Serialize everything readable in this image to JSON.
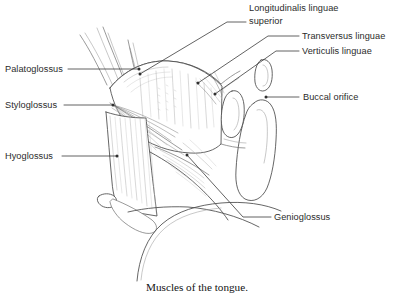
{
  "figure": {
    "caption": "Muscles of the tongue.",
    "background_color": "#ffffff",
    "line_color": "#4a4a4a",
    "label_color": "#2b2b2b",
    "width": 395,
    "height": 301
  },
  "labels": [
    {
      "id": "longitudinalis-linguae-superior",
      "line1": "Longitudinalis linguae",
      "line2": "superior",
      "text_x": 249,
      "text_y": 11,
      "text_y2": 24,
      "anchor": "start",
      "leader": "M 246 22 L 227 22 L 140 74",
      "dot_x": 140,
      "dot_y": 74
    },
    {
      "id": "transversus-linguae",
      "line1": "Transversus linguae",
      "line2": "",
      "text_x": 302,
      "text_y": 39,
      "text_y2": 0,
      "anchor": "start",
      "leader": "M 299 36 L 268 36 L 198 83",
      "dot_x": 198,
      "dot_y": 83
    },
    {
      "id": "verticulis-linguae",
      "line1": "Verticulis linguae",
      "line2": "",
      "text_x": 302,
      "text_y": 54,
      "text_y2": 0,
      "anchor": "start",
      "leader": "M 299 51 L 276 51 L 215 94",
      "dot_x": 215,
      "dot_y": 94
    },
    {
      "id": "buccal-orifice",
      "line1": "Buccal orifice",
      "line2": "",
      "text_x": 303,
      "text_y": 100,
      "text_y2": 0,
      "anchor": "start",
      "leader": "M 299 97 L 266 97",
      "dot_x": 266,
      "dot_y": 97
    },
    {
      "id": "palatoglossus",
      "line1": "Palatoglossus",
      "line2": "",
      "text_x": 5,
      "text_y": 72,
      "text_y2": 0,
      "anchor": "start",
      "leader": "M 68 69 L 139 69",
      "dot_x": 139,
      "dot_y": 69
    },
    {
      "id": "styloglossus",
      "line1": "Styloglossus",
      "line2": "",
      "text_x": 5,
      "text_y": 108,
      "text_y2": 0,
      "anchor": "start",
      "leader": "M 64 105 L 113 105",
      "dot_x": 113,
      "dot_y": 105
    },
    {
      "id": "hyoglossus",
      "line1": "Hyoglossus",
      "line2": "",
      "text_x": 5,
      "text_y": 159,
      "text_y2": 0,
      "anchor": "start",
      "leader": "M 62 156 L 117 156",
      "dot_x": 117,
      "dot_y": 156
    },
    {
      "id": "genioglossus",
      "line1": "Genioglossus",
      "line2": "",
      "text_x": 274,
      "text_y": 220,
      "text_y2": 0,
      "anchor": "start",
      "leader": "M 271 217 L 243 217 L 187 155",
      "dot_x": 187,
      "dot_y": 155
    }
  ],
  "caption_position": {
    "x": 197,
    "y": 291
  }
}
